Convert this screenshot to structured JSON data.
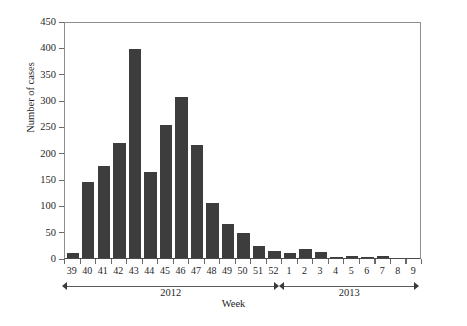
{
  "chart_data": {
    "type": "bar",
    "title": "",
    "xlabel": "Week",
    "ylabel": "Number of cases",
    "ylim": [
      0,
      450
    ],
    "ytick_step": 50,
    "yticks": [
      450,
      400,
      350,
      300,
      250,
      200,
      150,
      100,
      50,
      0
    ],
    "grid": false,
    "legend": null,
    "bar_color": "#3d3d3d",
    "axis_color": "#8e8e8e",
    "categories": [
      "39",
      "40",
      "41",
      "42",
      "43",
      "44",
      "45",
      "46",
      "47",
      "48",
      "49",
      "50",
      "51",
      "52",
      "1",
      "2",
      "3",
      "4",
      "5",
      "6",
      "7",
      "8",
      "9"
    ],
    "values": [
      10,
      145,
      175,
      218,
      396,
      163,
      252,
      306,
      214,
      105,
      65,
      48,
      22,
      13,
      10,
      18,
      12,
      2,
      4,
      1,
      3,
      0,
      0
    ],
    "groups": [
      {
        "label": "2012",
        "start_category": "39",
        "end_category": "52"
      },
      {
        "label": "2013",
        "start_category": "1",
        "end_category": "9"
      }
    ],
    "series": [
      {
        "name": "Number of cases",
        "points": [
          {
            "week": "39",
            "year": "2012",
            "value": 10
          },
          {
            "week": "40",
            "year": "2012",
            "value": 145
          },
          {
            "week": "41",
            "year": "2012",
            "value": 175
          },
          {
            "week": "42",
            "year": "2012",
            "value": 218
          },
          {
            "week": "43",
            "year": "2012",
            "value": 396
          },
          {
            "week": "44",
            "year": "2012",
            "value": 163
          },
          {
            "week": "45",
            "year": "2012",
            "value": 252
          },
          {
            "week": "46",
            "year": "2012",
            "value": 306
          },
          {
            "week": "47",
            "year": "2012",
            "value": 214
          },
          {
            "week": "48",
            "year": "2012",
            "value": 105
          },
          {
            "week": "49",
            "year": "2012",
            "value": 65
          },
          {
            "week": "50",
            "year": "2012",
            "value": 48
          },
          {
            "week": "51",
            "year": "2012",
            "value": 22
          },
          {
            "week": "52",
            "year": "2012",
            "value": 13
          },
          {
            "week": "1",
            "year": "2013",
            "value": 10
          },
          {
            "week": "2",
            "year": "2013",
            "value": 18
          },
          {
            "week": "3",
            "year": "2013",
            "value": 12
          },
          {
            "week": "4",
            "year": "2013",
            "value": 2
          },
          {
            "week": "5",
            "year": "2013",
            "value": 4
          },
          {
            "week": "6",
            "year": "2013",
            "value": 1
          },
          {
            "week": "7",
            "year": "2013",
            "value": 3
          },
          {
            "week": "8",
            "year": "2013",
            "value": 0
          },
          {
            "week": "9",
            "year": "2013",
            "value": 0
          }
        ]
      }
    ]
  }
}
